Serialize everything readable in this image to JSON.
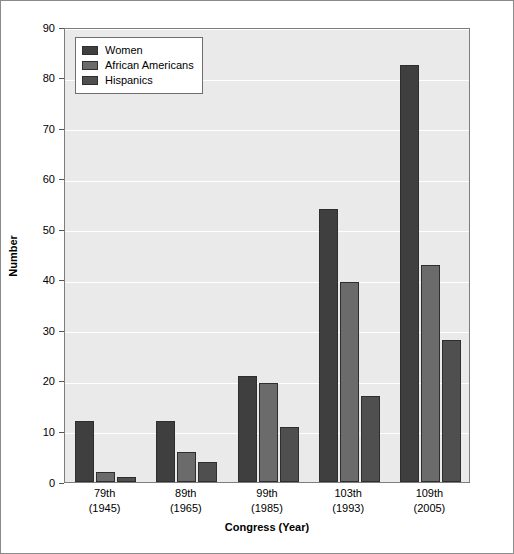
{
  "chart_data": {
    "type": "bar",
    "title": "",
    "xlabel": "Congress (Year)",
    "ylabel": "Number",
    "ylim": [
      0,
      90
    ],
    "ytick_step": 10,
    "yticks": [
      0,
      10,
      20,
      30,
      40,
      50,
      60,
      70,
      80,
      90
    ],
    "grid": true,
    "grid_axis": "y",
    "legend_position": "top-left",
    "categories": [
      "79th",
      "89th",
      "99th",
      "103th",
      "109th"
    ],
    "category_years": [
      "(1945)",
      "(1965)",
      "(1985)",
      "(1993)",
      "(2005)"
    ],
    "category_labels": [
      {
        "congress": "79th",
        "year": "(1945)"
      },
      {
        "congress": "89th",
        "year": "(1965)"
      },
      {
        "congress": "99th",
        "year": "(1985)"
      },
      {
        "congress": "103th",
        "year": "(1993)"
      },
      {
        "congress": "109th",
        "year": "(2005)"
      }
    ],
    "series": [
      {
        "name": "Women",
        "color": "#3f3f3f",
        "values": [
          12,
          12,
          21,
          54,
          82.5
        ]
      },
      {
        "name": "African Americans",
        "color": "#6b6b6b",
        "values": [
          2,
          6,
          19.5,
          39.5,
          43
        ]
      },
      {
        "name": "Hispanics",
        "color": "#4f4f4f",
        "values": [
          1,
          4,
          10.8,
          17,
          28
        ]
      }
    ]
  },
  "legend": {
    "items": [
      {
        "label": "Women"
      },
      {
        "label": "African Americans"
      },
      {
        "label": "Hispanics"
      }
    ]
  },
  "axes": {
    "y_title": "Number",
    "x_title": "Congress (Year)"
  },
  "colors": {
    "plot_background": "#eaeaea",
    "figure_background": "#ffffff",
    "gridline": "#ffffff",
    "axis_line": "#7d7d7d",
    "bar_outline": "#2e2e2e"
  }
}
